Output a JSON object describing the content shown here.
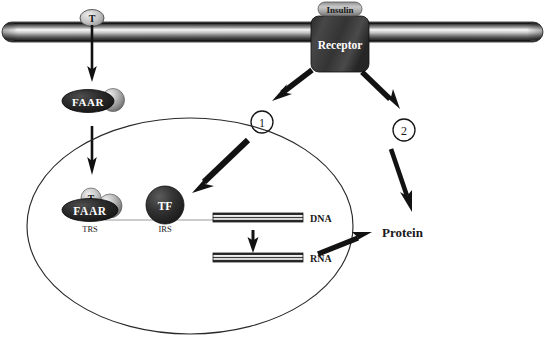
{
  "diagram": {
    "membrane": {
      "name": "cell-membrane",
      "color_dark": "#2e2e2e",
      "color_light": "#e8e8e8"
    },
    "ligands": {
      "thyroid_hormone_label": "T",
      "insulin_label": "Insulin"
    },
    "receptor": {
      "label": "Receptor",
      "color": "#3a3a3a"
    },
    "cytoplasm": {
      "faar_label": "FAAR"
    },
    "nucleus": {
      "faar_label": "FAAR",
      "faar_ligand_label": "T",
      "faar_site_label": "TRS",
      "tf_label": "TF",
      "tf_site_label": "IRS",
      "dna_label": "DNA",
      "rna_label": "RNA"
    },
    "pathways": {
      "path1_label": "1",
      "path2_label": "2"
    },
    "products": {
      "protein_label": "Protein"
    },
    "colors": {
      "ink": "#1a1a1a",
      "faar_fill": "#2a2a2a",
      "tf_fill": "#3a3a3a",
      "sphere_light": "#d8d8d8",
      "sphere_mid": "#9a9a9a",
      "ligand_circle": "#cccccc"
    }
  }
}
